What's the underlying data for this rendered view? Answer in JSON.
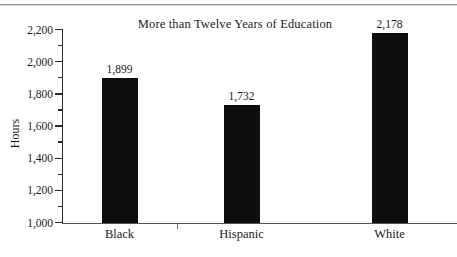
{
  "chart_data": {
    "type": "bar",
    "title": "More than Twelve Years of Education",
    "xlabel": "",
    "ylabel": "Hours",
    "categories": [
      "Black",
      "Hispanic",
      "White"
    ],
    "values": [
      1899,
      1732,
      2178
    ],
    "value_labels": [
      "1,899",
      "1,732",
      "2,178"
    ],
    "ylim": [
      1000,
      2200
    ],
    "ytick_values": [
      1000,
      1200,
      1400,
      1600,
      1800,
      2000,
      2200
    ],
    "ytick_labels": [
      "1,000",
      "1,200",
      "1,400",
      "1,600",
      "1,800",
      "2,000",
      "2,200"
    ],
    "yminor_tick_values": [
      1100,
      1300,
      1500,
      1700,
      1900,
      2100
    ],
    "grid": false,
    "legend": null,
    "bar_color": "#0d0d0d",
    "axis_color": "#2b2b2b",
    "background": "#ffffff"
  },
  "figure": {
    "title": "More than Twelve Years of Education",
    "axis_title_y": "Hours"
  }
}
